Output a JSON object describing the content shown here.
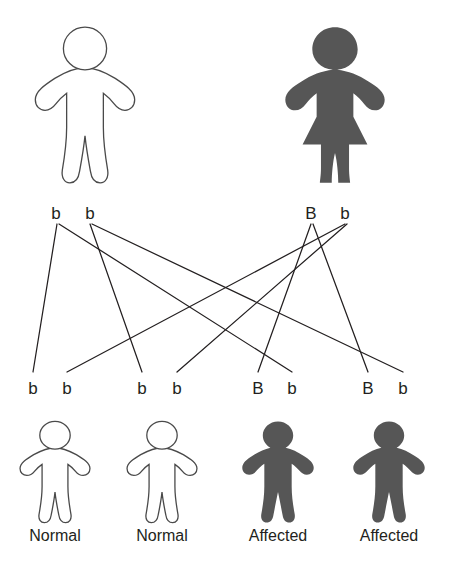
{
  "diagram": {
    "colors": {
      "affected_fill": "#565656",
      "unaffected_fill": "#ffffff",
      "outline": "#4a4a4a",
      "line": "#231f20",
      "background": "#ffffff",
      "text": "#231f20"
    }
  },
  "parents": [
    {
      "name": "father-figure",
      "sex": "male",
      "status": "unaffected",
      "filled": false,
      "x": 85,
      "y": 25,
      "scale": 1.0
    },
    {
      "name": "mother-figure",
      "sex": "female",
      "status": "affected",
      "filled": true,
      "x": 335,
      "y": 25,
      "scale": 1.0
    }
  ],
  "parent_alleles": [
    {
      "label": "b",
      "x": 56,
      "y": 205,
      "parent": "father"
    },
    {
      "label": "b",
      "x": 90,
      "y": 205,
      "parent": "father"
    },
    {
      "label": "B",
      "x": 311,
      "y": 205,
      "parent": "mother"
    },
    {
      "label": "b",
      "x": 345,
      "y": 205,
      "parent": "mother"
    }
  ],
  "offspring_alleles": [
    {
      "label": "b",
      "x": 33,
      "y": 380,
      "child": 1,
      "from": "father"
    },
    {
      "label": "b",
      "x": 67,
      "y": 380,
      "child": 1,
      "from": "mother"
    },
    {
      "label": "b",
      "x": 142,
      "y": 380,
      "child": 2,
      "from": "father"
    },
    {
      "label": "b",
      "x": 177,
      "y": 380,
      "child": 2,
      "from": "mother"
    },
    {
      "label": "B",
      "x": 258,
      "y": 380,
      "child": 3,
      "from": "mother"
    },
    {
      "label": "b",
      "x": 292,
      "y": 380,
      "child": 3,
      "from": "father"
    },
    {
      "label": "B",
      "x": 368,
      "y": 380,
      "child": 4,
      "from": "mother"
    },
    {
      "label": "b",
      "x": 403,
      "y": 380,
      "child": 4,
      "from": "father"
    }
  ],
  "inheritance_lines": [
    {
      "from": "father-b1",
      "to": "child1-left",
      "x1": 57,
      "y1": 224,
      "x2": 33,
      "y2": 372
    },
    {
      "from": "father-b1",
      "to": "child3-right",
      "x1": 59,
      "y1": 224,
      "x2": 292,
      "y2": 372
    },
    {
      "from": "father-b2",
      "to": "child2-left",
      "x1": 90,
      "y1": 224,
      "x2": 142,
      "y2": 372
    },
    {
      "from": "father-b2",
      "to": "child4-right",
      "x1": 92,
      "y1": 224,
      "x2": 403,
      "y2": 372
    },
    {
      "from": "mother-B",
      "to": "child3-left",
      "x1": 311,
      "y1": 224,
      "x2": 258,
      "y2": 372
    },
    {
      "from": "mother-B",
      "to": "child4-left",
      "x1": 313,
      "y1": 224,
      "x2": 368,
      "y2": 372
    },
    {
      "from": "mother-b",
      "to": "child1-right",
      "x1": 345,
      "y1": 224,
      "x2": 67,
      "y2": 372
    },
    {
      "from": "mother-b",
      "to": "child2-right",
      "x1": 347,
      "y1": 224,
      "x2": 177,
      "y2": 372
    }
  ],
  "children": [
    {
      "name": "child-1",
      "status": "unaffected",
      "filled": false,
      "genotype": "bb",
      "caption": "Normal",
      "x": 55,
      "y": 420,
      "caption_x": 55,
      "caption_y": 527
    },
    {
      "name": "child-2",
      "status": "unaffected",
      "filled": false,
      "genotype": "bb",
      "caption": "Normal",
      "x": 162,
      "y": 420,
      "caption_x": 162,
      "caption_y": 527
    },
    {
      "name": "child-3",
      "status": "affected",
      "filled": true,
      "genotype": "Bb",
      "caption": "Affected",
      "x": 278,
      "y": 420,
      "caption_x": 278,
      "caption_y": 527
    },
    {
      "name": "child-4",
      "status": "affected",
      "filled": true,
      "genotype": "Bb",
      "caption": "Affected",
      "x": 389,
      "y": 420,
      "caption_x": 389,
      "caption_y": 527
    }
  ]
}
